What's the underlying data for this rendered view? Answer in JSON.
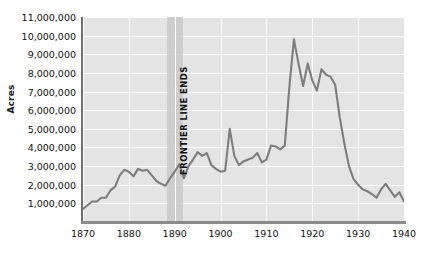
{
  "chart_data": {
    "type": "line",
    "title": "",
    "subtitle": "",
    "xlabel": "",
    "ylabel": "Acres",
    "xlim": [
      1870,
      1940
    ],
    "ylim": [
      0,
      11000000
    ],
    "grid": true,
    "legend": null,
    "y_ticks": [
      "11,000,000",
      "10,000,000",
      "9,000,000",
      "8,000,000",
      "7,000,000",
      "6,000,000",
      "5,000,000",
      "4,000,000",
      "3,000,000",
      "2,000,000",
      "1,000,000"
    ],
    "y_tick_values": [
      11000000,
      10000000,
      9000000,
      8000000,
      7000000,
      6000000,
      5000000,
      4000000,
      3000000,
      2000000,
      1000000
    ],
    "x_ticks": [
      "1870",
      "1880",
      "1890",
      "1900",
      "1910",
      "1920",
      "1930",
      "1940"
    ],
    "x_tick_values": [
      1870,
      1880,
      1890,
      1900,
      1910,
      1920,
      1930,
      1940
    ],
    "annotations": [
      {
        "label": "FRONTIER LINE ENDS",
        "x": 1890,
        "orientation": "vertical",
        "marker": "shaded-band"
      }
    ],
    "series": [
      {
        "name": "Acres",
        "color": "#7d7d7d",
        "x": [
          1870,
          1871,
          1872,
          1873,
          1874,
          1875,
          1876,
          1877,
          1878,
          1879,
          1880,
          1881,
          1882,
          1883,
          1884,
          1885,
          1886,
          1887,
          1888,
          1889,
          1890,
          1891,
          1892,
          1893,
          1894,
          1895,
          1896,
          1897,
          1898,
          1899,
          1900,
          1901,
          1902,
          1903,
          1904,
          1905,
          1906,
          1907,
          1908,
          1909,
          1910,
          1911,
          1912,
          1913,
          1914,
          1915,
          1916,
          1917,
          1918,
          1919,
          1920,
          1921,
          1922,
          1923,
          1924,
          1925,
          1926,
          1927,
          1928,
          1929,
          1930,
          1931,
          1932,
          1933,
          1934,
          1935,
          1936,
          1937,
          1938,
          1939,
          1940
        ],
        "values": [
          700000,
          900000,
          1100000,
          1100000,
          1300000,
          1300000,
          1700000,
          1900000,
          2500000,
          2800000,
          2700000,
          2450000,
          2850000,
          2750000,
          2800000,
          2500000,
          2200000,
          2050000,
          1950000,
          2350000,
          2700000,
          3100000,
          2350000,
          3000000,
          3350000,
          3750000,
          3550000,
          3700000,
          3050000,
          2850000,
          2700000,
          2750000,
          5000000,
          3550000,
          3050000,
          3250000,
          3350000,
          3450000,
          3700000,
          3200000,
          3350000,
          4100000,
          4050000,
          3900000,
          4100000,
          7250000,
          9800000,
          8500000,
          7300000,
          8500000,
          7600000,
          7050000,
          8200000,
          7900000,
          7800000,
          7350000,
          5600000,
          4200000,
          3000000,
          2300000,
          2000000,
          1750000,
          1650000,
          1500000,
          1300000,
          1750000,
          2050000,
          1700000,
          1350000,
          1600000,
          1100000
        ]
      }
    ]
  }
}
